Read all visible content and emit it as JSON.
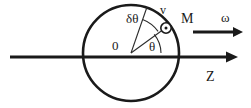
{
  "figure": {
    "labels": {
      "delta_theta": "δθ",
      "velocity": "v",
      "mass_point": "M",
      "angular_velocity": "ω",
      "center": "0",
      "theta": "θ",
      "axis": "Z"
    },
    "colors": {
      "stroke": "#1a1a1a",
      "thin_stroke": "#2b2b2b",
      "background": "#ffffff"
    },
    "geometry": {
      "circle": {
        "cx": 131,
        "cy": 53,
        "r": 48
      },
      "axis_line": {
        "x1": 10,
        "y1": 57,
        "x2": 232,
        "y2": 57
      },
      "omega_arrow": {
        "x1": 193,
        "y1": 32,
        "x2": 241,
        "y2": 32
      },
      "ray_theta": {
        "x1": 131,
        "y1": 53,
        "x2": 166,
        "y2": 28
      },
      "ray_delta": {
        "x1": 131,
        "y1": 53,
        "x2": 147,
        "y2": 8
      },
      "marker": {
        "cx": 166,
        "cy": 28,
        "r": 5,
        "dot_r": 1.4
      },
      "arc_theta_radius": 30,
      "arc_delta_radius": 34
    }
  }
}
